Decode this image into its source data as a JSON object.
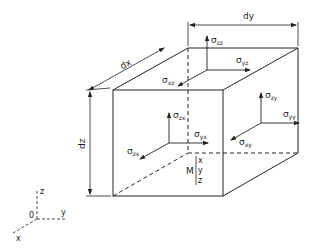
{
  "diagram": {
    "dimensions": {
      "dx": "dx",
      "dy": "dy",
      "dz": "dz"
    },
    "stresses": {
      "top": [
        {
          "sym": "σ",
          "sub": "zz"
        },
        {
          "sym": "σ",
          "sub": "yz"
        },
        {
          "sym": "σ",
          "sub": "xz"
        }
      ],
      "right": [
        {
          "sym": "σ",
          "sub": "zy"
        },
        {
          "sym": "σ",
          "sub": "yy"
        },
        {
          "sym": "σ",
          "sub": "xy"
        }
      ],
      "front": [
        {
          "sym": "σ",
          "sub": "zx"
        },
        {
          "sym": "σ",
          "sub": "yx"
        },
        {
          "sym": "σ",
          "sub": "zx"
        }
      ]
    },
    "center_point": {
      "label": "M",
      "coords": [
        "x",
        "y",
        "z"
      ]
    },
    "axes": {
      "origin": "0",
      "x": "x",
      "y": "y",
      "z": "z"
    }
  }
}
